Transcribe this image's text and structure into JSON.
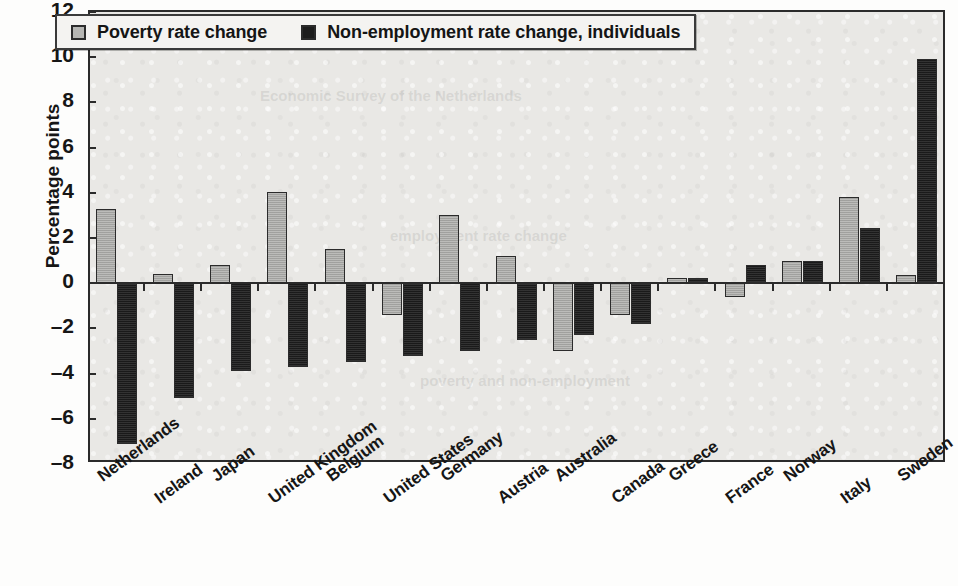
{
  "chart_data": {
    "type": "bar",
    "title": "",
    "xlabel": "",
    "ylabel": "Percentage points",
    "ylim": [
      -8,
      12
    ],
    "ytick_values": [
      12,
      10,
      8,
      6,
      4,
      2,
      0,
      -2,
      -4,
      -6,
      -8
    ],
    "ytick_labels": [
      "12",
      "10",
      "8",
      "6",
      "4",
      "2",
      "0",
      "–2",
      "–4",
      "–6",
      "–8"
    ],
    "grid": false,
    "legend_position": "top-left-inside",
    "categories": [
      "Netherlands",
      "Ireland",
      "Japan",
      "United Kingdom",
      "Belgium",
      "United States",
      "Germany",
      "Austria",
      "Australia",
      "Canada",
      "Greece",
      "France",
      "Norway",
      "Italy",
      "Sweden"
    ],
    "series": [
      {
        "name": "Poverty rate change",
        "color": "#a9a9a6",
        "values": [
          3.3,
          0.4,
          0.8,
          4.05,
          1.5,
          -1.4,
          3.0,
          1.2,
          -3.0,
          -1.4,
          0.25,
          -0.6,
          1.0,
          3.8,
          0.35
        ]
      },
      {
        "name": "Non-employment rate change, individuals",
        "color": "#232323",
        "values": [
          -7.1,
          -5.1,
          -3.9,
          -3.7,
          -3.5,
          -3.2,
          -3.0,
          -2.5,
          -2.3,
          -1.8,
          0.25,
          0.8,
          1.0,
          2.45,
          9.9
        ]
      }
    ]
  },
  "legend": {
    "entries": [
      {
        "label": "Poverty rate change",
        "swatch": "light"
      },
      {
        "label": "Non-employment rate change, individuals",
        "swatch": "dark"
      }
    ]
  },
  "axis": {
    "y_title": "Percentage points"
  },
  "ghost_text": {
    "a": "Economic Survey of the Netherlands",
    "b": "employment rate change",
    "c": "poverty and non-employment"
  }
}
